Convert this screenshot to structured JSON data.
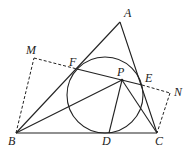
{
  "diagram": {
    "type": "geometry",
    "points": {
      "A": {
        "label": "A",
        "x": 120,
        "y": 22,
        "lx": 124,
        "ly": 17
      },
      "B": {
        "label": "B",
        "x": 16,
        "y": 133,
        "lx": 8,
        "ly": 145
      },
      "C": {
        "label": "C",
        "x": 157,
        "y": 133,
        "lx": 157,
        "ly": 145
      },
      "D": {
        "label": "D",
        "x": 109,
        "y": 133,
        "lx": 102,
        "ly": 145
      },
      "E": {
        "label": "E",
        "x": 142,
        "y": 85,
        "lx": 145,
        "ly": 82
      },
      "F": {
        "label": "F",
        "x": 77,
        "y": 69,
        "lx": 69,
        "ly": 66
      },
      "P": {
        "label": "P",
        "x": 122,
        "y": 80,
        "lx": 117,
        "ly": 76
      },
      "M": {
        "label": "M",
        "x": 34,
        "y": 58,
        "lx": 27,
        "ly": 54
      },
      "N": {
        "label": "N",
        "x": 170,
        "y": 93,
        "lx": 174,
        "ly": 96
      }
    },
    "circle": {
      "cx": 105,
      "cy": 95,
      "r": 38
    },
    "solid_segments": [
      "AB",
      "AC",
      "BC",
      "FP",
      "PE",
      "BP",
      "PD",
      "PC"
    ],
    "dashed_segments": [
      "BM",
      "MF",
      "EN",
      "NC"
    ],
    "stroke_color": "#222222"
  }
}
